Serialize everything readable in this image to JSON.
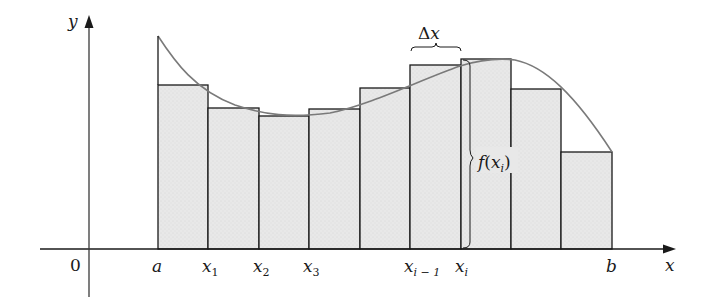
{
  "diagram": {
    "axes": {
      "x_label": "x",
      "y_label": "y",
      "origin_label": "0"
    },
    "colors": {
      "rect_fill": "#e6e6e6",
      "rect_stroke": "#1a1a1a",
      "curve": "#7a7a7a",
      "axis": "#3a3a3a"
    },
    "tick_labels": [
      {
        "base": "a",
        "sub": "",
        "x": 158
      },
      {
        "base": "x",
        "sub": "1",
        "x": 208
      },
      {
        "base": "x",
        "sub": "2",
        "x": 259
      },
      {
        "base": "x",
        "sub": "3",
        "x": 309
      },
      {
        "base": "x",
        "sub": "i − 1",
        "x": 410
      },
      {
        "base": "x",
        "sub": "i",
        "x": 461
      },
      {
        "base": "b",
        "sub": "",
        "x": 612
      }
    ],
    "delta_label": {
      "symbol": "Δ",
      "var": "x"
    },
    "height_label": {
      "func": "f",
      "var": "x",
      "sub": "i"
    },
    "rectangles": [
      {
        "x0": 158,
        "x1": 208,
        "top": 85
      },
      {
        "x0": 208,
        "x1": 259,
        "top": 108
      },
      {
        "x0": 259,
        "x1": 309,
        "top": 116
      },
      {
        "x0": 309,
        "x1": 360,
        "top": 109
      },
      {
        "x0": 360,
        "x1": 410,
        "top": 88
      },
      {
        "x0": 410,
        "x1": 461,
        "top": 65
      },
      {
        "x0": 461,
        "x1": 511,
        "top": 59
      },
      {
        "x0": 511,
        "x1": 561,
        "top": 89
      },
      {
        "x0": 561,
        "x1": 612,
        "top": 152
      }
    ]
  }
}
